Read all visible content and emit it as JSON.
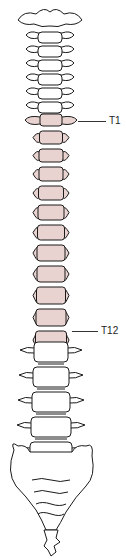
{
  "figure": {
    "labels": [
      {
        "text": "T1",
        "x": 109,
        "y": 116,
        "line_x1": 78,
        "line_x2": 106,
        "line_y": 121
      },
      {
        "text": "T12",
        "x": 101,
        "y": 326,
        "line_x1": 72,
        "line_x2": 98,
        "line_y": 331
      }
    ],
    "regions": [
      {
        "name": "cervical",
        "count": 7,
        "color": "#ffffff"
      },
      {
        "name": "thoracic",
        "count": 12,
        "color": "#e8d3d0"
      },
      {
        "name": "lumbar",
        "count": 5,
        "color": "#ffffff"
      },
      {
        "name": "sacrum",
        "count": 1,
        "color": "#ffffff"
      },
      {
        "name": "coccyx",
        "count": 1,
        "color": "#ffffff"
      }
    ],
    "colors": {
      "outline": "#1a1a1a",
      "thoracic_fill": "#e8d3d0",
      "bone_fill": "#ffffff",
      "background": "#ffffff"
    }
  }
}
